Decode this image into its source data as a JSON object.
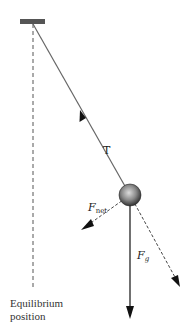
{
  "diagram": {
    "type": "pendulum-free-body-diagram",
    "labels": {
      "tension": "T",
      "net_force_main": "F",
      "net_force_sub": "net",
      "gravity_main": "F",
      "gravity_sub": "g",
      "equilibrium_line1": "Equilibrium",
      "equilibrium_line2": "position"
    },
    "colors": {
      "ceiling": "#555555",
      "string": "#666666",
      "arrow": "#111111",
      "dashed": "#444444",
      "ball_light": "#d8d8d8",
      "ball_dark": "#3a3a3a"
    },
    "elements": {
      "ceiling": {
        "x": 20,
        "y": 19,
        "width": 25,
        "height": 5
      },
      "pivot": {
        "x": 33,
        "y": 24
      },
      "bob": {
        "cx": 130,
        "cy": 195,
        "r": 11
      },
      "equilibrium_line": {
        "x": 33,
        "y1": 24,
        "y2": 290
      },
      "tension_arrow_tip": {
        "x": 82,
        "y": 113
      },
      "net_force_arrow_tip": {
        "x": 82,
        "y": 229
      },
      "gravity_arrow_tip": {
        "x": 130,
        "y": 318
      },
      "radial_component_tip": {
        "x": 180,
        "y": 286
      }
    }
  }
}
